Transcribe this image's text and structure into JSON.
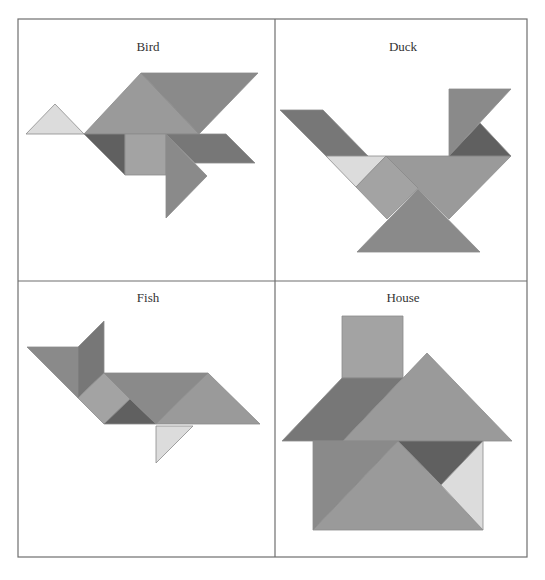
{
  "figure": {
    "grid": {
      "left": 18,
      "top": 19,
      "right": 527,
      "bottom": 557,
      "mid_x": 275,
      "mid_y": 281,
      "stroke": "#6f6f6f"
    },
    "colors": {
      "light": "#dcdcdc",
      "medium_light": "#a3a3a3",
      "medium": "#9a9a9a",
      "medium_dark": "#8a8a8a",
      "dark": "#777777",
      "darkest": "#606060",
      "edge": "#8c8c8c"
    },
    "panels": [
      {
        "id": "bird",
        "title": "Bird",
        "title_x": 148,
        "title_y": 40,
        "pieces": [
          {
            "name": "small-triangle-light",
            "color": "light",
            "points": "26,134 55,104 84,134"
          },
          {
            "name": "large-triangle-left",
            "color": "medium",
            "points": "84,134 141,73 199,134"
          },
          {
            "name": "large-triangle-top",
            "color": "medium_dark",
            "points": "141,73 258,73 199,134"
          },
          {
            "name": "small-triangle-dark",
            "color": "darkest",
            "points": "84,134 125,134 125,175"
          },
          {
            "name": "square",
            "color": "medium_light",
            "points": "125,134 166,134 166,175 125,175"
          },
          {
            "name": "parallelogram",
            "color": "dark",
            "points": "166,134 226,134 255,163 195,163"
          },
          {
            "name": "medium-triangle",
            "color": "medium_dark",
            "points": "166,134 207,176 166,218"
          }
        ]
      },
      {
        "id": "duck",
        "title": "Duck",
        "title_x": 403,
        "title_y": 40,
        "pieces": [
          {
            "name": "parallelogram-tail",
            "color": "dark",
            "points": "280,110 323,110 368,156 326,156"
          },
          {
            "name": "small-triangle-light",
            "color": "light",
            "points": "326,156 386,156 356,187"
          },
          {
            "name": "square",
            "color": "medium_light",
            "points": "386,156 418,188 387,219 356,187"
          },
          {
            "name": "large-triangle-body",
            "color": "medium",
            "points": "386,156 511,156 449,219 418,188"
          },
          {
            "name": "large-triangle-base",
            "color": "medium_dark",
            "points": "357,252 418,189 480,252"
          },
          {
            "name": "medium-triangle-neck",
            "color": "medium_dark",
            "points": "449,89 511,89 449,156"
          },
          {
            "name": "small-triangle-head",
            "color": "darkest",
            "points": "449,156 480,123 511,156"
          }
        ]
      },
      {
        "id": "fish",
        "title": "Fish",
        "title_x": 148,
        "title_y": 291,
        "pieces": [
          {
            "name": "medium-triangle-tail",
            "color": "medium_dark",
            "points": "27,347 78,347 78,398"
          },
          {
            "name": "parallelogram-tail",
            "color": "dark",
            "points": "78,347 104,321 104,373 78,398"
          },
          {
            "name": "square",
            "color": "medium_light",
            "points": "78,398 104,373 130,399 104,424"
          },
          {
            "name": "large-triangle-body-top",
            "color": "medium_dark",
            "points": "104,373 208,373 156,424 130,399"
          },
          {
            "name": "small-triangle-dark",
            "color": "darkest",
            "points": "104,424 130,399 156,424"
          },
          {
            "name": "large-triangle-body-right",
            "color": "medium",
            "points": "156,424 208,373 260,424"
          },
          {
            "name": "small-triangle-fin",
            "color": "light",
            "points": "156,426 193,426 156,463"
          }
        ]
      },
      {
        "id": "house",
        "title": "House",
        "title_x": 403,
        "title_y": 291,
        "pieces": [
          {
            "name": "square-chimney",
            "color": "medium_light",
            "points": "342,316 403,316 403,378 342,378"
          },
          {
            "name": "parallelogram-roof",
            "color": "dark",
            "points": "342,378 403,378 343,441 282,441"
          },
          {
            "name": "large-triangle-roof",
            "color": "medium",
            "points": "343,441 427,353 512,441"
          },
          {
            "name": "medium-triangle-wall-left",
            "color": "medium_dark",
            "points": "313,441 398,441 313,530"
          },
          {
            "name": "large-triangle-wall-center",
            "color": "medium",
            "points": "313,530 398,441 483,530"
          },
          {
            "name": "small-triangle-dark",
            "color": "darkest",
            "points": "398,441 483,441 441,485"
          },
          {
            "name": "small-triangle-light",
            "color": "light",
            "points": "483,441 483,530 441,485"
          }
        ]
      }
    ]
  }
}
